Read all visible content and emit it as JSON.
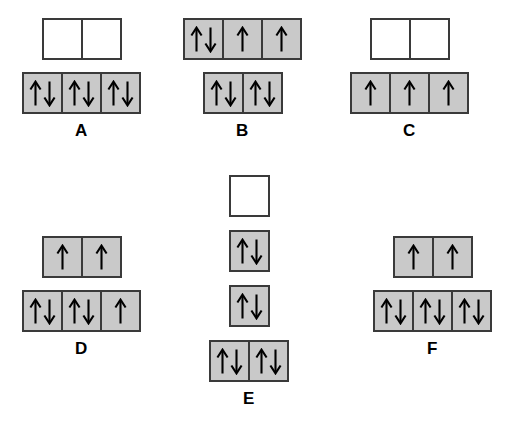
{
  "figure": {
    "background_color": "#ffffff",
    "box_fill_shaded": "#c9c9c9",
    "box_fill_empty": "#ffffff",
    "box_border_color": "#3a3a3a",
    "arrow_color": "#000000",
    "arrow_up": "↑",
    "arrow_down": "↓"
  },
  "diagrams": [
    {
      "id": "a",
      "label": "A",
      "rows": [
        {
          "name": "upper-row",
          "boxes": [
            {
              "fill": "empty",
              "arrows": []
            },
            {
              "fill": "empty",
              "arrows": []
            }
          ]
        },
        {
          "name": "lower-row",
          "boxes": [
            {
              "fill": "filled",
              "arrows": [
                "↑",
                "↓"
              ]
            },
            {
              "fill": "filled",
              "arrows": [
                "↑",
                "↓"
              ]
            },
            {
              "fill": "filled",
              "arrows": [
                "↑",
                "↓"
              ]
            }
          ]
        }
      ]
    },
    {
      "id": "b",
      "label": "B",
      "rows": [
        {
          "name": "upper-row",
          "boxes": [
            {
              "fill": "filled",
              "arrows": [
                "↑",
                "↓"
              ]
            },
            {
              "fill": "half",
              "arrows": [
                "↑"
              ]
            },
            {
              "fill": "half",
              "arrows": [
                "↑"
              ]
            }
          ]
        },
        {
          "name": "lower-row",
          "boxes": [
            {
              "fill": "filled",
              "arrows": [
                "↑",
                "↓"
              ]
            },
            {
              "fill": "filled",
              "arrows": [
                "↑",
                "↓"
              ]
            }
          ]
        }
      ]
    },
    {
      "id": "c",
      "label": "C",
      "rows": [
        {
          "name": "upper-row",
          "boxes": [
            {
              "fill": "empty",
              "arrows": []
            },
            {
              "fill": "empty",
              "arrows": []
            }
          ]
        },
        {
          "name": "lower-row",
          "boxes": [
            {
              "fill": "half",
              "arrows": [
                "↑"
              ]
            },
            {
              "fill": "half",
              "arrows": [
                "↑"
              ]
            },
            {
              "fill": "half",
              "arrows": [
                "↑"
              ]
            }
          ]
        }
      ]
    },
    {
      "id": "d",
      "label": "D",
      "rows": [
        {
          "name": "upper-row",
          "boxes": [
            {
              "fill": "half",
              "arrows": [
                "↑"
              ]
            },
            {
              "fill": "half",
              "arrows": [
                "↑"
              ]
            }
          ]
        },
        {
          "name": "lower-row",
          "boxes": [
            {
              "fill": "filled",
              "arrows": [
                "↑",
                "↓"
              ]
            },
            {
              "fill": "filled",
              "arrows": [
                "↑",
                "↓"
              ]
            },
            {
              "fill": "half",
              "arrows": [
                "↑"
              ]
            }
          ]
        }
      ]
    },
    {
      "id": "e",
      "label": "E",
      "rows": [
        {
          "name": "row-1",
          "boxes": [
            {
              "fill": "empty",
              "arrows": []
            }
          ]
        },
        {
          "name": "row-2",
          "boxes": [
            {
              "fill": "filled",
              "arrows": [
                "↑",
                "↓"
              ]
            }
          ]
        },
        {
          "name": "row-3",
          "boxes": [
            {
              "fill": "filled",
              "arrows": [
                "↑",
                "↓"
              ]
            }
          ]
        },
        {
          "name": "row-4",
          "boxes": [
            {
              "fill": "filled",
              "arrows": [
                "↑",
                "↓"
              ]
            },
            {
              "fill": "filled",
              "arrows": [
                "↑",
                "↓"
              ]
            }
          ]
        }
      ]
    },
    {
      "id": "f",
      "label": "F",
      "rows": [
        {
          "name": "upper-row",
          "boxes": [
            {
              "fill": "half",
              "arrows": [
                "↑"
              ]
            },
            {
              "fill": "half",
              "arrows": [
                "↑"
              ]
            }
          ]
        },
        {
          "name": "lower-row",
          "boxes": [
            {
              "fill": "filled",
              "arrows": [
                "↑",
                "↓"
              ]
            },
            {
              "fill": "filled",
              "arrows": [
                "↑",
                "↓"
              ]
            },
            {
              "fill": "filled",
              "arrows": [
                "↑",
                "↓"
              ]
            }
          ]
        }
      ]
    }
  ]
}
